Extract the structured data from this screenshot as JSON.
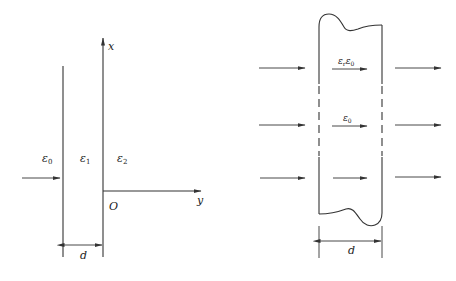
{
  "left_figure": {
    "regions": [
      {
        "symbol": "ε",
        "subscript": "0"
      },
      {
        "symbol": "ε",
        "subscript": "1"
      },
      {
        "symbol": "ε",
        "subscript": "2"
      }
    ],
    "axes": {
      "x_label": "x",
      "y_label": "y",
      "origin_label": "O"
    },
    "thickness_label": "d"
  },
  "right_figure": {
    "inner_labels": [
      {
        "symbol": "ε",
        "subscript": "r",
        "symbol2": "ε",
        "subscript2": "0"
      },
      {
        "symbol": "ε",
        "subscript": "0"
      }
    ],
    "thickness_label": "d"
  },
  "colors": {
    "line": "#333333",
    "text": "#222222",
    "background": "#ffffff"
  }
}
